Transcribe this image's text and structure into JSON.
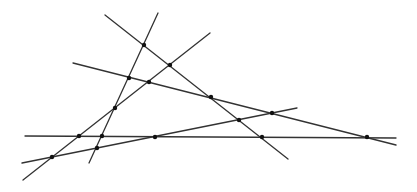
{
  "diagram": {
    "type": "line-arrangement",
    "width": 417,
    "height": 192,
    "colors": {
      "line": "#333333",
      "point": "#111111",
      "background": "#ffffff"
    },
    "lines": [
      {
        "id": "A",
        "x1": 158,
        "y1": 13,
        "x2": 89,
        "y2": 163
      },
      {
        "id": "B",
        "x1": 105,
        "y1": 15,
        "x2": 288,
        "y2": 159
      },
      {
        "id": "C",
        "x1": 210,
        "y1": 33,
        "x2": 23,
        "y2": 180
      },
      {
        "id": "D",
        "x1": 73,
        "y1": 63,
        "x2": 396,
        "y2": 145
      },
      {
        "id": "E",
        "x1": 25,
        "y1": 136,
        "x2": 396,
        "y2": 138
      },
      {
        "id": "F",
        "x1": 22,
        "y1": 163,
        "x2": 297,
        "y2": 108
      }
    ],
    "points": [
      {
        "id": "AB",
        "x": 144,
        "y": 45
      },
      {
        "id": "BC",
        "x": 170,
        "y": 65
      },
      {
        "id": "AD",
        "x": 129,
        "y": 78
      },
      {
        "id": "CD",
        "x": 149,
        "y": 82
      },
      {
        "id": "BD",
        "x": 211,
        "y": 97
      },
      {
        "id": "AC",
        "x": 115,
        "y": 108
      },
      {
        "id": "DF",
        "x": 272,
        "y": 113
      },
      {
        "id": "BF",
        "x": 239,
        "y": 120
      },
      {
        "id": "CE",
        "x": 79,
        "y": 136
      },
      {
        "id": "AE",
        "x": 102,
        "y": 136
      },
      {
        "id": "EF",
        "x": 155,
        "y": 137
      },
      {
        "id": "BE",
        "x": 262,
        "y": 137
      },
      {
        "id": "DE",
        "x": 367,
        "y": 137
      },
      {
        "id": "AF",
        "x": 97,
        "y": 148
      },
      {
        "id": "CF",
        "x": 52,
        "y": 157
      }
    ]
  }
}
